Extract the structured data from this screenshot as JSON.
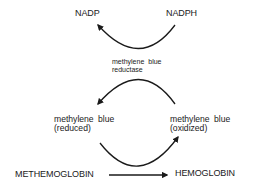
{
  "diagram": {
    "type": "biochemical-pathway",
    "colors": {
      "background": "#ffffff",
      "text": "#1a1a1a",
      "stroke": "#1a1a1a"
    },
    "nodes": {
      "nadp": "NADP",
      "nadph": "NADPH",
      "enzyme_line1": "methylene blue",
      "enzyme_line2": "reductase",
      "mb_reduced_line1": "methylene blue",
      "mb_reduced_line2": "(reduced)",
      "mb_oxidized_line1": "methylene blue",
      "mb_oxidized_line2": "(oxidized)",
      "methemoglobin": "METHEMOGLOBIN",
      "hemoglobin": "HEMOGLOBIN"
    },
    "edges": [
      {
        "from": "NADPH",
        "to": "NADP",
        "style": "curved-arrow"
      },
      {
        "from": "methylene blue (oxidized)",
        "to": "methylene blue (reduced)",
        "style": "curved-arrow",
        "label": "methylene blue reductase"
      },
      {
        "from": "methylene blue (reduced)",
        "to": "methylene blue (oxidized)",
        "style": "curved-arrow"
      },
      {
        "from": "METHEMOGLOBIN",
        "to": "HEMOGLOBIN",
        "style": "straight-arrow"
      }
    ]
  }
}
